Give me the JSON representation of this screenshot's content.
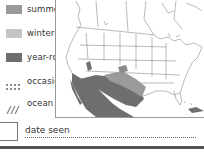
{
  "legend": {
    "items": [
      {
        "label": "summer",
        "swatch": "summer",
        "color": "#9a9a9a"
      },
      {
        "label": "winter",
        "swatch": "winter",
        "color": "#c4c4c4"
      },
      {
        "label": "year-round",
        "swatch": "year-round",
        "color": "#6e6e6e"
      },
      {
        "label": "occasional",
        "swatch": "dotted",
        "color": "#8a8a8a"
      },
      {
        "label": "ocean range",
        "swatch": "hatched",
        "color": "#8a8a8a"
      }
    ]
  },
  "map": {
    "region": "North America range map",
    "colors": {
      "land": "#ffffff",
      "lines": "#7a7a7a",
      "year_round": "#6e6e6e",
      "summer": "#9a9a9a"
    }
  },
  "footer": {
    "date_label": "date seen"
  }
}
